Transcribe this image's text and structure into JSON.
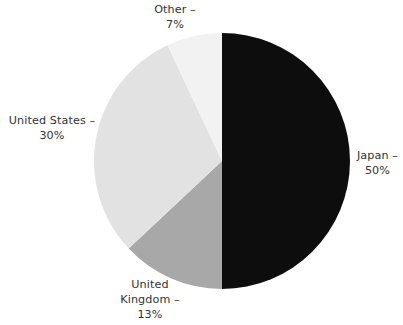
{
  "chart_data": {
    "type": "pie",
    "title": "",
    "subtitle": "",
    "xlabel": "",
    "ylabel": "",
    "legend_position": "none",
    "grid": false,
    "labels_outside": true,
    "start_angle_deg": 0,
    "direction": "clockwise",
    "categories": [
      "Japan",
      "United Kingdom",
      "United States",
      "Other"
    ],
    "values": [
      50,
      13,
      30,
      7
    ],
    "unit": "%",
    "slices": [
      {
        "name": "Japan",
        "value": 50,
        "percent_text": "50%",
        "label_text": "Japan –\n50%",
        "color": "#0d0d0d",
        "start_deg": 0,
        "end_deg": 180,
        "label_position": "right"
      },
      {
        "name": "United Kingdom",
        "value": 13,
        "percent_text": "13%",
        "label_text": "United\nKingdom –\n13%",
        "color": "#a8a8a8",
        "start_deg": 180,
        "end_deg": 226.8,
        "label_position": "bottom"
      },
      {
        "name": "United States",
        "value": 30,
        "percent_text": "30%",
        "label_text": "United States –\n30%",
        "color": "#e2e2e2",
        "start_deg": 226.8,
        "end_deg": 334.8,
        "label_position": "left"
      },
      {
        "name": "Other",
        "value": 7,
        "percent_text": "7%",
        "label_text": "Other –\n7%",
        "color": "#f2f2f2",
        "start_deg": 334.8,
        "end_deg": 360,
        "label_position": "top"
      }
    ],
    "geometry": {
      "center_x": 222,
      "center_y": 161,
      "radius": 128
    },
    "colors": {
      "background": "#ffffff",
      "text": "#333333",
      "japan": "#0d0d0d",
      "united_kingdom": "#a8a8a8",
      "united_states": "#e2e2e2",
      "other": "#f2f2f2"
    }
  }
}
